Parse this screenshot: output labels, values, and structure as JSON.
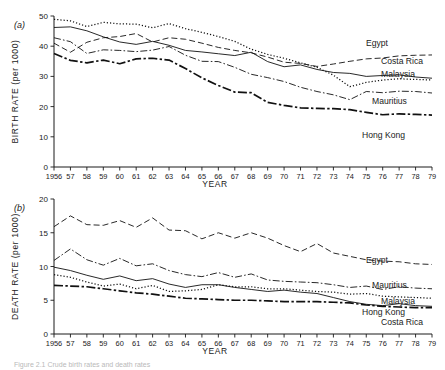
{
  "figure": {
    "caption_fragment": "Figure 2.1 Crude birth rates and death rates",
    "panels": [
      {
        "tag": "(a)",
        "name": "birth-rate-panel"
      },
      {
        "tag": "(b)",
        "name": "death-rate-panel"
      }
    ]
  },
  "chart_data": [
    {
      "type": "line",
      "panel": "(a)",
      "title": "",
      "xlabel": "YEAR",
      "ylabel": "BIRTH RATE (per 1000)",
      "xlim": [
        1956,
        1979
      ],
      "ylim": [
        0,
        50
      ],
      "yticks": [
        0,
        10,
        20,
        30,
        40,
        50
      ],
      "grid": false,
      "legend_position": "right-inline",
      "x": [
        1956,
        1957,
        1958,
        1959,
        1960,
        1961,
        1962,
        1963,
        1964,
        1965,
        1966,
        1967,
        1968,
        1969,
        1970,
        1971,
        1972,
        1973,
        1974,
        1975,
        1976,
        1977,
        1978,
        1979
      ],
      "tick_labels": [
        "1956",
        "57",
        "58",
        "59",
        "60",
        "61",
        "62",
        "63",
        "64",
        "65",
        "66",
        "67",
        "68",
        "69",
        "70",
        "71",
        "72",
        "73",
        "74",
        "75",
        "76",
        "77",
        "78",
        "79"
      ],
      "series": [
        {
          "name": "Egypt",
          "style": "dashed",
          "values": [
            41.0,
            38.0,
            41.3,
            42.8,
            43.2,
            44.2,
            41.4,
            42.8,
            42.3,
            41.0,
            39.6,
            38.6,
            37.8,
            36.4,
            34.7,
            34.3,
            33.3,
            34.1,
            35.0,
            35.8,
            36.1,
            36.8,
            37.0,
            37.1
          ]
        },
        {
          "name": "Costa Rica",
          "style": "solid",
          "values": [
            46.2,
            46.4,
            45.1,
            43.1,
            41.4,
            40.6,
            41.6,
            40.3,
            38.6,
            38.1,
            37.5,
            36.9,
            38.0,
            34.9,
            33.2,
            33.8,
            32.3,
            31.3,
            31.0,
            30.0,
            30.3,
            30.5,
            29.8,
            29.4
          ]
        },
        {
          "name": "Malaysia",
          "style": "dotted",
          "values": [
            48.9,
            48.4,
            46.5,
            47.9,
            47.4,
            47.3,
            46.1,
            47.5,
            45.8,
            44.6,
            43.2,
            41.6,
            39.0,
            37.3,
            36.0,
            34.5,
            33.0,
            30.4,
            26.6,
            28.0,
            28.8,
            29.2,
            29.0,
            28.8
          ]
        },
        {
          "name": "Mauritius",
          "style": "dashdot",
          "values": [
            42.8,
            41.5,
            37.6,
            38.8,
            38.6,
            38.2,
            38.7,
            39.9,
            37.0,
            35.0,
            34.9,
            33.0,
            30.7,
            29.6,
            28.3,
            26.4,
            25.0,
            23.9,
            22.3,
            25.0,
            24.6,
            25.1,
            25.0,
            24.5
          ]
        },
        {
          "name": "Hong Kong",
          "style": "longdashdot",
          "values": [
            37.6,
            35.3,
            34.5,
            35.4,
            34.2,
            35.8,
            36.0,
            35.4,
            32.6,
            29.5,
            27.0,
            24.8,
            24.6,
            21.4,
            20.4,
            19.6,
            19.4,
            19.3,
            19.0,
            18.1,
            17.3,
            17.6,
            17.4,
            17.2
          ]
        }
      ]
    },
    {
      "type": "line",
      "panel": "(b)",
      "title": "",
      "xlabel": "YEAR",
      "ylabel": "DEATH RATE (per 1000)",
      "xlim": [
        1956,
        1979
      ],
      "ylim": [
        0,
        20
      ],
      "yticks": [
        0,
        5,
        10,
        15,
        20
      ],
      "grid": false,
      "legend_position": "right-inline",
      "x": [
        1956,
        1957,
        1958,
        1959,
        1960,
        1961,
        1962,
        1963,
        1964,
        1965,
        1966,
        1967,
        1968,
        1969,
        1970,
        1971,
        1972,
        1973,
        1974,
        1975,
        1976,
        1977,
        1978,
        1979
      ],
      "tick_labels": [
        "1956",
        "57",
        "58",
        "59",
        "60",
        "61",
        "62",
        "63",
        "64",
        "65",
        "66",
        "67",
        "68",
        "69",
        "70",
        "71",
        "72",
        "73",
        "74",
        "75",
        "76",
        "77",
        "78",
        "79"
      ],
      "series": [
        {
          "name": "Egypt",
          "style": "dashed",
          "values": [
            15.9,
            17.5,
            16.2,
            16.1,
            16.8,
            15.8,
            17.2,
            15.4,
            15.3,
            14.1,
            15.0,
            14.2,
            15.0,
            14.2,
            13.1,
            12.2,
            13.4,
            12.0,
            11.5,
            11.0,
            10.8,
            10.7,
            10.4,
            10.3
          ]
        },
        {
          "name": "Mauritius",
          "style": "dashdot",
          "values": [
            10.9,
            12.6,
            11.0,
            10.2,
            11.2,
            10.1,
            10.4,
            9.4,
            8.8,
            8.5,
            9.1,
            8.4,
            8.9,
            8.0,
            7.8,
            7.7,
            7.6,
            7.3,
            6.9,
            7.1,
            6.6,
            7.0,
            6.8,
            6.7
          ]
        },
        {
          "name": "Malaysia",
          "style": "dotted",
          "values": [
            8.8,
            8.4,
            7.7,
            7.1,
            7.4,
            6.7,
            7.2,
            6.3,
            6.4,
            6.6,
            7.3,
            7.0,
            7.0,
            6.7,
            6.7,
            6.5,
            6.3,
            6.2,
            5.9,
            6.0,
            5.6,
            5.5,
            5.4,
            5.3
          ]
        },
        {
          "name": "Hong Kong",
          "style": "longdashdot",
          "values": [
            7.2,
            7.1,
            7.0,
            6.7,
            6.4,
            6.1,
            5.9,
            5.6,
            5.3,
            5.2,
            5.1,
            5.0,
            5.0,
            4.9,
            4.8,
            4.8,
            4.8,
            4.7,
            4.6,
            4.3,
            4.1,
            4.0,
            3.9,
            3.9
          ]
        },
        {
          "name": "Costa Rica",
          "style": "solid",
          "values": [
            9.9,
            9.4,
            8.7,
            8.1,
            8.6,
            7.9,
            8.2,
            7.4,
            6.9,
            7.3,
            7.3,
            6.9,
            6.6,
            6.3,
            6.5,
            6.2,
            6.0,
            5.4,
            4.8,
            4.4,
            4.2,
            4.5,
            4.2,
            4.1
          ]
        }
      ]
    }
  ]
}
